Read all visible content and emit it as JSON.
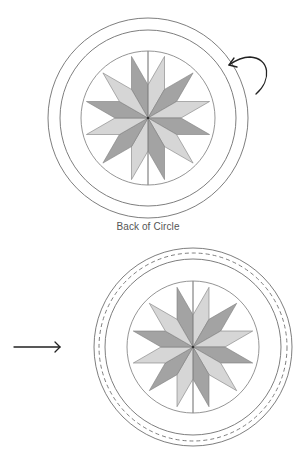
{
  "caption": "Back of Circle",
  "colors": {
    "dark_diamond": "#a3a3a3",
    "light_diamond": "#d6d6d6",
    "ring_stroke": "#6f6f6f",
    "arrow": "#222222"
  },
  "figures": [
    {
      "id": "top",
      "label": "back-of-circle-figure",
      "center": [
        148,
        118
      ],
      "rings": [
        {
          "type": "solid",
          "r": 100
        },
        {
          "type": "solid",
          "r": 88
        }
      ],
      "inner_circle_r": 67,
      "star": {
        "points": 12,
        "edge_length": 33,
        "first_tip_angle_deg": -15
      }
    },
    {
      "id": "bottom",
      "label": "sewn-circle-figure",
      "center": [
        193,
        347
      ],
      "rings": [
        {
          "type": "solid",
          "r": 99
        },
        {
          "type": "dashed",
          "r": 94
        },
        {
          "type": "solid",
          "r": 88
        }
      ],
      "inner_circle_r": 66,
      "star": {
        "points": 12,
        "edge_length": 32,
        "first_tip_angle_deg": -15
      }
    }
  ],
  "arrows": {
    "curved": {
      "description": "fold-over arrow",
      "path": "M256 94 C272 80 270 58 250 57 C242 57 236 60 229 65",
      "head": "M234 58 L229 65 L237 67"
    },
    "straight": {
      "description": "pointing arrow",
      "from": [
        14,
        347
      ],
      "to": [
        60,
        347
      ],
      "head": "M55 342 L60 347 L55 352"
    }
  }
}
